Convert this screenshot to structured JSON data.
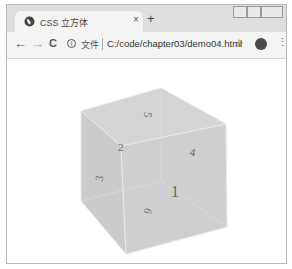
{
  "browser": {
    "tab": {
      "title": "CSS 立方体",
      "close_label": "×"
    },
    "new_tab_label": "+",
    "nav": {
      "back": "←",
      "forward": "→",
      "reload": "C"
    },
    "omnibox": {
      "security_label": "文件",
      "url": "C:/code/chapter03/demo04.html"
    },
    "icons": {
      "bookmark": "☆",
      "menu": "⋮"
    }
  },
  "cube": {
    "faces": [
      {
        "label": "1",
        "face": "front"
      },
      {
        "label": "2",
        "face": "back"
      },
      {
        "label": "3",
        "face": "left"
      },
      {
        "label": "4",
        "face": "right"
      },
      {
        "label": "5",
        "face": "top"
      },
      {
        "label": "6",
        "face": "bottom"
      }
    ],
    "color": "#cccccc"
  }
}
